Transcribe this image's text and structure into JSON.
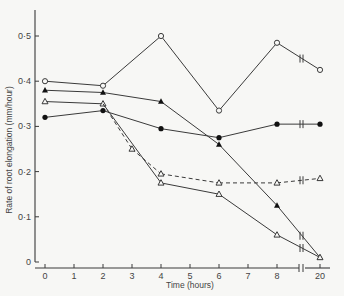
{
  "chart_data": {
    "type": "line",
    "title": "",
    "xlabel": "Time (hours)",
    "ylabel": "Rate of root elongation (mm/hour)",
    "x_ticks": [
      "0",
      "1",
      "2",
      "3",
      "4",
      "5",
      "6",
      "7",
      "8",
      "20"
    ],
    "y_ticks": [
      "0",
      "0·1",
      "0·2",
      "0·3",
      "0·4",
      "0·5"
    ],
    "ylim": [
      0,
      0.55
    ],
    "xlim": [
      0,
      20
    ],
    "x_axis_break": "between 8 and 20",
    "grid": false,
    "legend": "none",
    "series": [
      {
        "name": "open circles",
        "marker": "open-circle",
        "line": "solid",
        "x": [
          0,
          2,
          4,
          6,
          8,
          20
        ],
        "values": [
          0.4,
          0.39,
          0.5,
          0.335,
          0.485,
          0.425
        ]
      },
      {
        "name": "filled triangles",
        "marker": "filled-triangle",
        "line": "solid",
        "x": [
          0,
          2,
          4,
          6,
          8,
          20
        ],
        "values": [
          0.38,
          0.375,
          0.355,
          0.26,
          0.125,
          0.01
        ]
      },
      {
        "name": "open triangles (solid)",
        "marker": "open-triangle",
        "line": "solid",
        "x": [
          0,
          2,
          4,
          6,
          8,
          20
        ],
        "values": [
          0.355,
          0.35,
          0.175,
          0.15,
          0.06,
          0.01
        ]
      },
      {
        "name": "filled circles",
        "marker": "filled-circle",
        "line": "solid",
        "x": [
          0,
          2,
          4,
          6,
          8,
          20
        ],
        "values": [
          0.32,
          0.335,
          0.295,
          0.275,
          0.305,
          0.305
        ]
      },
      {
        "name": "open triangles (dashed)",
        "marker": "open-triangle",
        "line": "dashed",
        "x": [
          3,
          4,
          6,
          8,
          20
        ],
        "values": [
          0.25,
          0.195,
          0.175,
          0.175,
          0.185
        ]
      }
    ]
  },
  "axes": {
    "xlabel": "Time (hours)",
    "ylabel": "Rate of root elongation (mm/hour)"
  }
}
